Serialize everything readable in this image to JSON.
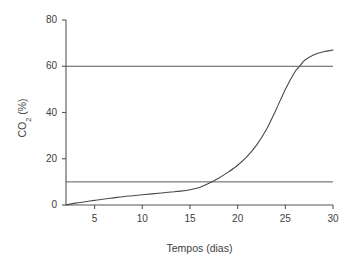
{
  "chart_data": {
    "type": "line",
    "title": "",
    "xlabel": "Tempos (dias)",
    "ylabel": "CO2 (%)",
    "ylabel_parts": {
      "base": "CO",
      "subscript": "2",
      "unit": " (%)"
    },
    "xlim": [
      2,
      30
    ],
    "ylim": [
      0,
      80
    ],
    "xticks": [
      5,
      10,
      15,
      20,
      25,
      30
    ],
    "xtick_labels": [
      "5",
      "10",
      "15",
      "20",
      "25",
      "30"
    ],
    "yticks": [
      0,
      20,
      40,
      60,
      80
    ],
    "ytick_labels": [
      "0",
      "20",
      "40",
      "60",
      "80"
    ],
    "grid": false,
    "legend": "none",
    "series": [
      {
        "name": "CO2",
        "kind": "curve",
        "x": [
          2,
          3,
          4,
          5,
          6,
          7,
          8,
          9,
          10,
          11,
          12,
          13,
          14,
          15,
          16,
          17,
          18,
          19,
          20,
          21,
          22,
          23,
          24,
          25,
          26,
          26.5,
          27,
          28,
          29,
          30
        ],
        "y": [
          0,
          0.8,
          1.4,
          2.0,
          2.6,
          3.1,
          3.6,
          4.0,
          4.4,
          4.8,
          5.2,
          5.6,
          6.0,
          6.6,
          7.6,
          9.4,
          11.6,
          14.2,
          17.2,
          21.0,
          26.0,
          32.5,
          41.0,
          50.0,
          57.5,
          60.0,
          62.5,
          65.0,
          66.3,
          67.0
        ]
      }
    ],
    "reference_lines": [
      {
        "name": "upper-threshold",
        "value": 60,
        "orientation": "horizontal"
      },
      {
        "name": "lower-threshold",
        "value": 10,
        "orientation": "horizontal"
      }
    ],
    "colors": {
      "background": "#ffffff",
      "axis": "#555555",
      "curve": "#4a4a4a",
      "reference_line": "#5a5a5a",
      "text": "#3d3d3d"
    }
  }
}
